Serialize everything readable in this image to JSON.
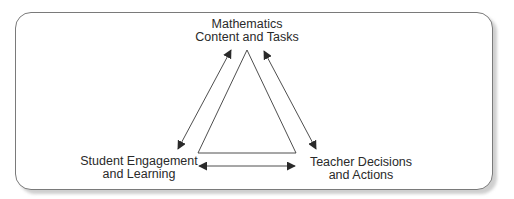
{
  "diagram": {
    "type": "triangle-relationship",
    "nodes": {
      "top": {
        "line1": "Mathematics",
        "line2": "Content and Tasks"
      },
      "bottom_left": {
        "line1": "Student Engagement",
        "line2": "and Learning"
      },
      "bottom_right": {
        "line1": "Teacher Decisions",
        "line2": "and Actions"
      }
    },
    "edges": [
      {
        "from": "top",
        "to": "bottom_left",
        "style": "double-arrow"
      },
      {
        "from": "top",
        "to": "bottom_right",
        "style": "double-arrow"
      },
      {
        "from": "bottom_left",
        "to": "bottom_right",
        "style": "double-arrow"
      }
    ],
    "colors": {
      "line": "#3a3a3a",
      "frame": "#7a7a7a",
      "shadow": "#cfcfcf",
      "text": "#2a2a2a"
    }
  }
}
